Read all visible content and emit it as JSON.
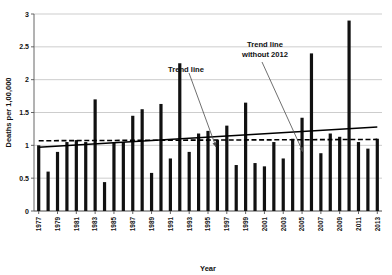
{
  "chart_data": {
    "type": "bar",
    "title": "",
    "xlabel": "Year",
    "ylabel": "Deaths per 1,00,000",
    "ylim": [
      0,
      3
    ],
    "ytick_values": [
      0,
      0.5,
      1,
      1.5,
      2,
      2.5,
      3
    ],
    "ytick_labels": [
      "0",
      "0.5",
      "1",
      "1.5",
      "2",
      "2.5",
      "3"
    ],
    "grid": true,
    "legend": "none",
    "categories": [
      "1977",
      "1978",
      "1979",
      "1980",
      "1981",
      "1982",
      "1983",
      "1984",
      "1985",
      "1986",
      "1987",
      "1988",
      "1989",
      "1990",
      "1991",
      "1992",
      "1993",
      "1994",
      "1995",
      "1996",
      "1997",
      "1998",
      "1999",
      "2000",
      "2001",
      "2002",
      "2003",
      "2004",
      "2005",
      "2006",
      "2007",
      "2008",
      "2009",
      "2010",
      "2011",
      "2012",
      "2013"
    ],
    "xtick_labels": [
      "1977",
      "1979",
      "1981",
      "1983",
      "1985",
      "1987",
      "1989",
      "1991",
      "1993",
      "1995",
      "1997",
      "1999",
      "2001",
      "2003",
      "2005",
      "2007",
      "2009",
      "2011",
      "2013"
    ],
    "values": [
      1.0,
      0.6,
      0.9,
      1.05,
      1.08,
      1.05,
      1.7,
      0.44,
      1.05,
      1.05,
      1.45,
      1.55,
      0.58,
      1.63,
      0.8,
      2.25,
      0.9,
      1.18,
      1.22,
      1.08,
      1.3,
      0.7,
      1.65,
      0.73,
      0.68,
      1.05,
      0.8,
      1.1,
      1.42,
      2.4,
      0.88,
      1.18,
      1.13,
      2.9,
      1.05,
      0.95,
      1.1
    ],
    "series": [
      {
        "name": "Trend line",
        "type": "line",
        "style": "solid",
        "x_start": "1977",
        "x_end": "2013",
        "y_start": 0.97,
        "y_end": 1.28
      },
      {
        "name": "Trend line without 2012",
        "type": "line",
        "style": "dashed",
        "x_start": "1977",
        "x_end": "2013",
        "y_start": 1.07,
        "y_end": 1.09
      }
    ],
    "annotations": [
      {
        "text": "Trend line",
        "target_series": "Trend line"
      },
      {
        "text": "Trend line without 2012",
        "target_series": "Trend line without 2012"
      }
    ]
  }
}
